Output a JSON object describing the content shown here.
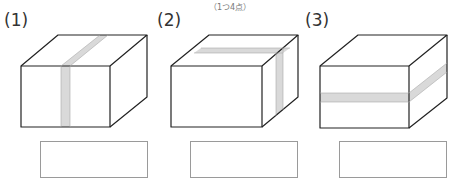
{
  "header": {
    "points_note": "（1つ4点）"
  },
  "questions": [
    {
      "number": "(1)",
      "tape": "vertical-front-and-top",
      "answer": ""
    },
    {
      "number": "(2)",
      "tape": "side-and-top",
      "answer": ""
    },
    {
      "number": "(3)",
      "tape": "horizontal-front-and-side",
      "answer": ""
    }
  ],
  "colors": {
    "line": "#222222",
    "tape": "#d9d9d9",
    "answer_border": "#9a9a9a"
  }
}
